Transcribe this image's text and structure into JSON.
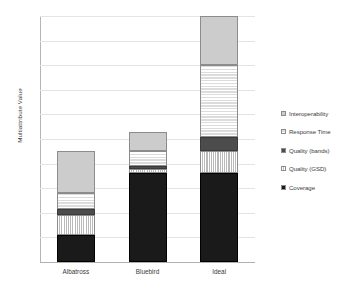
{
  "chart_data": {
    "type": "bar",
    "subtype": "stacked-bar",
    "title": "",
    "xlabel": "",
    "ylabel": "Multiattribute Value",
    "ylim": [
      0,
      100
    ],
    "ytick_step": 10,
    "yticks": [
      0,
      10,
      20,
      30,
      40,
      50,
      60,
      70,
      80,
      90,
      100
    ],
    "grid": true,
    "grid_axis": "y",
    "legend_position": "right",
    "categories": [
      "Albatross",
      "Bluebird",
      "Ideal"
    ],
    "series": [
      {
        "name": "Coverage",
        "values": [
          11,
          36,
          36
        ],
        "color": "#1a1a1a",
        "pattern": "solid-black"
      },
      {
        "name": "Quality (GSD)",
        "values": [
          8,
          2,
          9
        ],
        "color": "#b9b9b9",
        "pattern": "vertical-lines"
      },
      {
        "name": "Quality (bands)",
        "values": [
          2.5,
          1,
          6
        ],
        "color": "#4c4c4c",
        "pattern": "solid-dark-gray"
      },
      {
        "name": "Response Time",
        "values": [
          6.5,
          6,
          29
        ],
        "color": "#f2f2f2",
        "pattern": "fine-grid"
      },
      {
        "name": "Interoperability",
        "values": [
          17,
          8,
          20
        ],
        "color": "#cccccc",
        "pattern": "solid-light-gray"
      }
    ],
    "totals": [
      45,
      53,
      100
    ],
    "legend_order": [
      "Interoperability",
      "Response Time",
      "Quality (bands)",
      "Quality (GSD)",
      "Coverage"
    ]
  },
  "axis": {
    "y_title": "Multiattribute Value",
    "y_tick_labels": [
      "100",
      "90",
      "80",
      "70",
      "60",
      "50",
      "40",
      "30",
      "20",
      "10",
      "0"
    ],
    "x_tick_labels": [
      "Albatross",
      "Bluebird",
      "Ideal"
    ]
  },
  "legend": {
    "items": [
      {
        "label": "Interoperability"
      },
      {
        "label": "Response Time"
      },
      {
        "label": "Quality (bands)"
      },
      {
        "label": "Quality (GSD)"
      },
      {
        "label": "Coverage"
      }
    ]
  }
}
